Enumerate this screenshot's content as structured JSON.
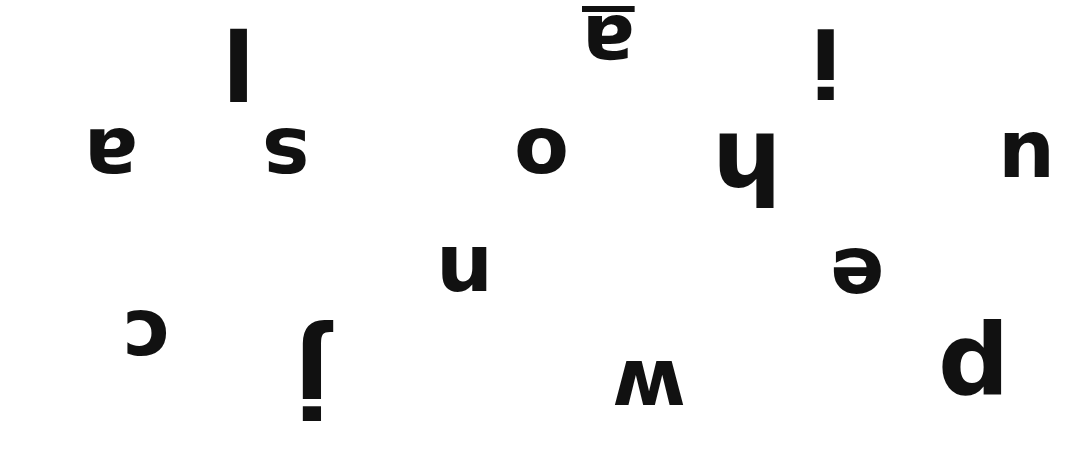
{
  "background": "#ffffff",
  "ink": "#111111",
  "letters": [
    {
      "id": "l",
      "char": "l",
      "underline": false
    },
    {
      "id": "a1",
      "char": "a",
      "underline": true
    },
    {
      "id": "i",
      "char": "i",
      "underline": false
    },
    {
      "id": "a2",
      "char": "a",
      "underline": false
    },
    {
      "id": "s",
      "char": "s",
      "underline": false
    },
    {
      "id": "o",
      "char": "o",
      "underline": false
    },
    {
      "id": "h",
      "char": "h",
      "underline": false
    },
    {
      "id": "u",
      "char": "u",
      "underline": false
    },
    {
      "id": "n",
      "char": "n",
      "underline": false
    },
    {
      "id": "e",
      "char": "e",
      "underline": false
    },
    {
      "id": "c",
      "char": "c",
      "underline": false
    },
    {
      "id": "j",
      "char": "j",
      "underline": false
    },
    {
      "id": "w",
      "char": "w",
      "underline": false
    },
    {
      "id": "p",
      "char": "p",
      "underline": false
    }
  ]
}
